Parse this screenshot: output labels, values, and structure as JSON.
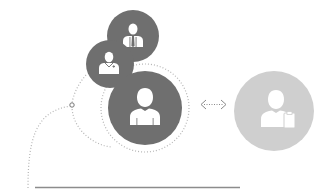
{
  "diagram": {
    "colors": {
      "dark_circle": "#6f6f6f",
      "light_circle": "#cfcfcf",
      "icon_fill": "#ffffff",
      "dotted_line": "#b5b5b5",
      "arrow": "#8a8a8a",
      "baseline": "#8c8c8c"
    },
    "nodes": [
      {
        "id": "businessman",
        "icon": "businessman-tie-icon",
        "cx": 133,
        "cy": 36,
        "r": 26
      },
      {
        "id": "doctor",
        "icon": "doctor-icon",
        "cx": 110,
        "cy": 64,
        "r": 24
      },
      {
        "id": "person-main",
        "icon": "person-icon",
        "cx": 145,
        "cy": 108,
        "r": 37
      },
      {
        "id": "person-clipboard",
        "icon": "person-clipboard-icon",
        "cx": 274,
        "cy": 111,
        "r": 40
      }
    ],
    "connector": {
      "icon": "bidirectional-arrow-icon",
      "label": "<······>"
    }
  }
}
